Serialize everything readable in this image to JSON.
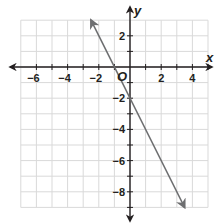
{
  "chart_data": {
    "type": "line",
    "title": "",
    "xlabel": "x",
    "ylabel": "y",
    "origin_label": "O",
    "xlim": [
      -7,
      5
    ],
    "ylim": [
      -9,
      3
    ],
    "grid": true,
    "x_ticks": [
      -6,
      -4,
      -2,
      2,
      4
    ],
    "y_ticks": [
      2,
      -2,
      -4,
      -6,
      -8
    ],
    "x_tick_labels": [
      "−6",
      "−4",
      "−2",
      "2",
      "4"
    ],
    "y_tick_labels": [
      "2",
      "−2",
      "−4",
      "−6",
      "−8"
    ],
    "series": [
      {
        "name": "line",
        "equation": "y = -2x - 2",
        "slope": -2,
        "intercept": -2,
        "x": [
          -2.5,
          -1,
          0,
          3.5
        ],
        "y": [
          3,
          0,
          -2,
          -9
        ],
        "arrows": "both"
      }
    ],
    "colors": {
      "grid": "#d9d9d9",
      "axis": "#231f20",
      "line": "#6d6e70",
      "text": "#231f20"
    }
  }
}
